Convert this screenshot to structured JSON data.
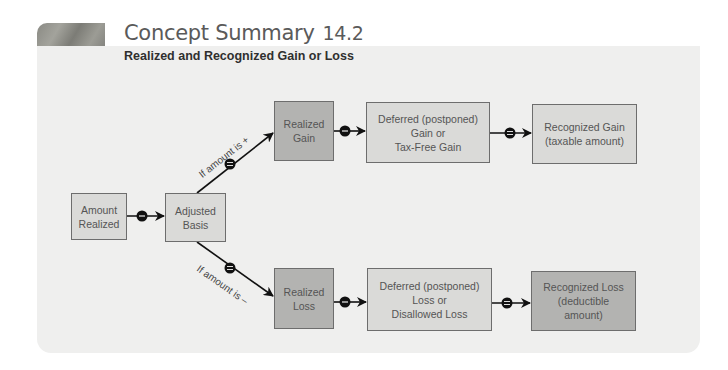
{
  "header": {
    "title": "Concept Summary",
    "number": "14.2",
    "subtitle": "Realized and Recognized Gain or Loss"
  },
  "nodes": {
    "amount_realized": "Amount\nRealized",
    "adjusted_basis": "Adjusted\nBasis",
    "realized_gain": "Realized\nGain",
    "deferred_gain": "Deferred (postponed)\nGain or\nTax-Free Gain",
    "recognized_gain": "Recognized Gain\n(taxable amount)",
    "realized_loss": "Realized\nLoss",
    "deferred_loss": "Deferred (postponed)\nLoss or\nDisallowed Loss",
    "recognized_loss": "Recognized Loss\n(deductible\namount)"
  },
  "branches": {
    "positive_label": "If amount is +",
    "negative_label": "If amount is –"
  },
  "operators": {
    "minus": "–",
    "equals": "="
  },
  "colors": {
    "panel": "#efefee",
    "light_box": "#dadad8",
    "dark_box": "#b3b3b1",
    "connector": "#111111"
  }
}
